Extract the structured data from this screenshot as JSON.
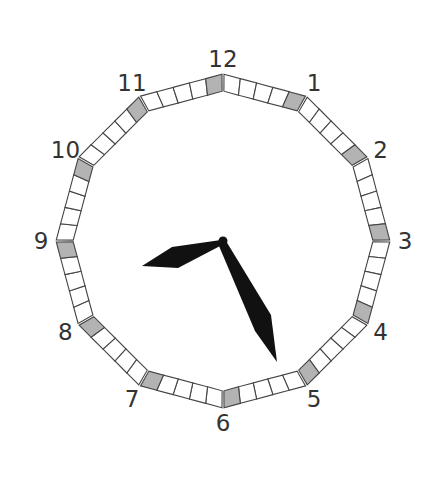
{
  "clock": {
    "center": [
      223,
      241
    ],
    "outer_radius": 167,
    "inner_radius": 150,
    "label_radius": 182,
    "hour_labels": [
      "12",
      "1",
      "2",
      "3",
      "4",
      "5",
      "6",
      "7",
      "8",
      "9",
      "10",
      "11"
    ],
    "cells_per_edge": 5,
    "shaded_cell": "last cell of each clockwise edge, adjacent to the next hour mark",
    "colors": {
      "cell_fill": "#ffffff",
      "cell_shaded_fill": "#b3b3b3",
      "cell_stroke": "#444444",
      "hands": "#111111",
      "labels": "#333333"
    },
    "time_shown": {
      "hour_hand_points_to": "between 8 and 9 (approx 8:25 position)",
      "minute_hand_points_to": "approx 25 minutes",
      "reading": "8:25"
    }
  }
}
